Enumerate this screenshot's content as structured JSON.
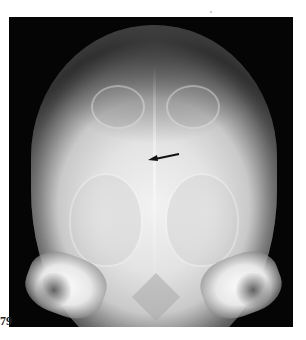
{
  "figure": {
    "label": "79",
    "annotation": {
      "type": "arrow",
      "direction": "left-pointing",
      "color": "#111111"
    }
  },
  "colors": {
    "background": "#ffffff",
    "film": "#050505",
    "bone": "#e6e6e6"
  }
}
